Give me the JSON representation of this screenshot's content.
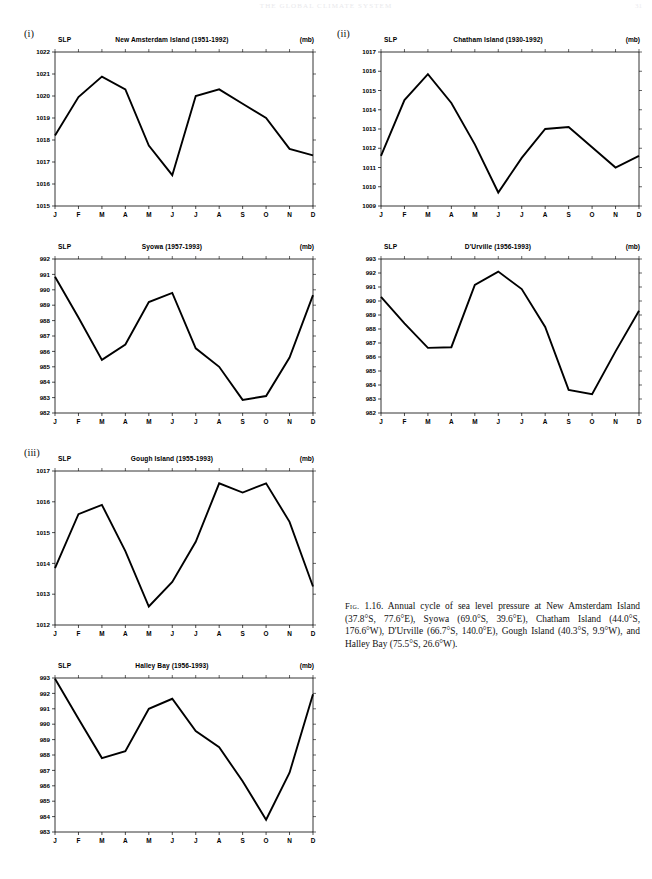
{
  "page": {
    "header": "THE GLOBAL CLIMATE SYSTEM",
    "number": "31"
  },
  "groups": [
    {
      "id": "group-i",
      "label": "(i)"
    },
    {
      "id": "group-ii",
      "label": "(ii)"
    },
    {
      "id": "group-iii",
      "label": "(iii)"
    }
  ],
  "axis": {
    "slp_label": "SLP",
    "unit_label": "(mb)",
    "months": [
      "J",
      "F",
      "M",
      "A",
      "M",
      "J",
      "J",
      "A",
      "S",
      "O",
      "N",
      "D"
    ]
  },
  "caption": {
    "fig_tag": "Fig.",
    "number": "1.16.",
    "text": "Annual cycle of sea level pressure at New Amsterdam Island (37.8°S, 77.6°E), Syowa (69.0°S, 39.6°E), Chatham Island (44.0°S, 176.6°W), D'Urville (66.7°S, 140.0°E), Gough Island (40.3°S, 9.9°W), and Halley Bay (75.5°S, 26.6°W)."
  },
  "chart_data": [
    {
      "id": "new-amsterdam-island",
      "type": "line",
      "title": "New Amsterdam Island (1951-1992)",
      "station": "New Amsterdam Island",
      "period": "1951-1992",
      "xlabel": "",
      "ylabel": "SLP",
      "unit": "mb",
      "categories": [
        "J",
        "F",
        "M",
        "A",
        "M",
        "J",
        "J",
        "A",
        "S",
        "O",
        "N",
        "D"
      ],
      "values": [
        1018.2,
        1019.95,
        1020.88,
        1020.3,
        1017.75,
        1016.4,
        1020.0,
        1020.3,
        1019.65,
        1019.0,
        1017.6,
        1017.3
      ],
      "ylim": [
        1015,
        1022
      ],
      "yticks": [
        1015,
        1016,
        1017,
        1018,
        1019,
        1020,
        1021,
        1022
      ],
      "grid": false,
      "legend": "none"
    },
    {
      "id": "chatham-island",
      "type": "line",
      "title": "Chatham Island (1930-1992)",
      "station": "Chatham Island",
      "period": "1930-1992",
      "xlabel": "",
      "ylabel": "SLP",
      "unit": "mb",
      "categories": [
        "J",
        "F",
        "M",
        "A",
        "M",
        "J",
        "J",
        "A",
        "S",
        "O",
        "N",
        "D"
      ],
      "values": [
        1011.6,
        1014.5,
        1015.85,
        1014.35,
        1012.2,
        1009.7,
        1011.5,
        1013.0,
        1013.1,
        1012.05,
        1011.0,
        1011.6
      ],
      "ylim": [
        1009,
        1017
      ],
      "yticks": [
        1009,
        1010,
        1011,
        1012,
        1013,
        1014,
        1015,
        1016,
        1017
      ],
      "grid": false,
      "legend": "none"
    },
    {
      "id": "syowa",
      "type": "line",
      "title": "Syowa (1957-1993)",
      "station": "Syowa",
      "period": "1957-1993",
      "xlabel": "",
      "ylabel": "SLP",
      "unit": "mb",
      "categories": [
        "J",
        "F",
        "M",
        "A",
        "M",
        "J",
        "J",
        "A",
        "S",
        "O",
        "N",
        "D"
      ],
      "values": [
        990.85,
        988.2,
        985.45,
        986.45,
        989.2,
        989.8,
        986.2,
        985.0,
        982.85,
        983.1,
        985.6,
        989.65
      ],
      "ylim": [
        982,
        992
      ],
      "yticks": [
        982,
        983,
        984,
        985,
        986,
        987,
        988,
        989,
        990,
        991,
        992
      ],
      "grid": false,
      "legend": "none"
    },
    {
      "id": "durville",
      "type": "line",
      "title": "D'Urville (1956-1993)",
      "station": "D'Urville",
      "period": "1956-1993",
      "xlabel": "",
      "ylabel": "SLP",
      "unit": "mb",
      "categories": [
        "J",
        "F",
        "M",
        "A",
        "M",
        "J",
        "J",
        "A",
        "S",
        "O",
        "N",
        "D"
      ],
      "values": [
        990.3,
        988.4,
        986.65,
        986.7,
        991.15,
        992.1,
        990.85,
        988.15,
        983.65,
        983.35,
        986.4,
        989.3
      ],
      "ylim": [
        982,
        993
      ],
      "yticks": [
        982,
        983,
        984,
        985,
        986,
        987,
        988,
        989,
        990,
        991,
        992,
        993
      ],
      "grid": false,
      "legend": "none"
    },
    {
      "id": "gough-island",
      "type": "line",
      "title": "Gough Island (1955-1993)",
      "station": "Gough Island",
      "period": "1955-1993",
      "xlabel": "",
      "ylabel": "SLP",
      "unit": "mb",
      "categories": [
        "J",
        "F",
        "M",
        "A",
        "M",
        "J",
        "J",
        "A",
        "S",
        "O",
        "N",
        "D"
      ],
      "values": [
        1013.85,
        1015.6,
        1015.9,
        1014.4,
        1012.6,
        1013.4,
        1014.7,
        1016.6,
        1016.3,
        1016.6,
        1015.35,
        1013.25
      ],
      "ylim": [
        1012,
        1017
      ],
      "yticks": [
        1012,
        1013,
        1014,
        1015,
        1016,
        1017
      ],
      "grid": false,
      "legend": "none"
    },
    {
      "id": "halley-bay",
      "type": "line",
      "title": "Halley Bay (1956-1993)",
      "station": "Halley Bay",
      "period": "1956-1993",
      "xlabel": "",
      "ylabel": "SLP",
      "unit": "mb",
      "categories": [
        "J",
        "F",
        "M",
        "A",
        "M",
        "J",
        "J",
        "A",
        "S",
        "O",
        "N",
        "D"
      ],
      "values": [
        992.95,
        990.35,
        987.8,
        988.25,
        991.0,
        991.65,
        989.55,
        988.5,
        986.3,
        983.8,
        986.85,
        991.95
      ],
      "ylim": [
        983,
        993
      ],
      "yticks": [
        983,
        984,
        985,
        986,
        987,
        988,
        989,
        990,
        991,
        992,
        993
      ],
      "grid": false,
      "legend": "none"
    }
  ],
  "chart_positions": [
    {
      "id": "new-amsterdam-island",
      "left": 22,
      "top": 36
    },
    {
      "id": "chatham-island",
      "left": 348,
      "top": 36
    },
    {
      "id": "syowa",
      "left": 22,
      "top": 243
    },
    {
      "id": "durville",
      "left": 348,
      "top": 243
    },
    {
      "id": "gough-island",
      "left": 22,
      "top": 455
    },
    {
      "id": "halley-bay",
      "left": 22,
      "top": 662
    }
  ]
}
